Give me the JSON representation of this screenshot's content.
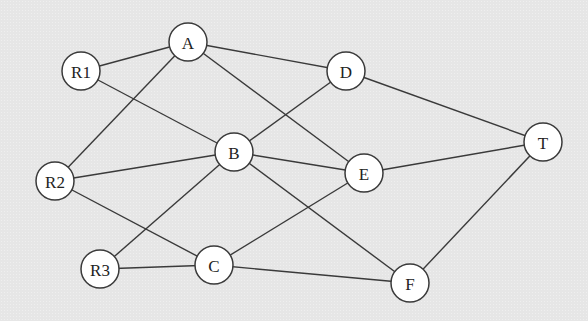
{
  "diagram": {
    "type": "network-graph",
    "colors": {
      "background": "#e6e6e6",
      "node_fill": "#ffffff",
      "stroke": "#3a3a3a",
      "text": "#222222"
    },
    "nodes": [
      {
        "id": "A",
        "label": "A"
      },
      {
        "id": "R1",
        "label": "R1"
      },
      {
        "id": "D",
        "label": "D"
      },
      {
        "id": "B",
        "label": "B"
      },
      {
        "id": "T",
        "label": "T"
      },
      {
        "id": "R2",
        "label": "R2"
      },
      {
        "id": "E",
        "label": "E"
      },
      {
        "id": "R3",
        "label": "R3"
      },
      {
        "id": "C",
        "label": "C"
      },
      {
        "id": "F",
        "label": "F"
      }
    ],
    "edges": [
      [
        "R1",
        "A"
      ],
      [
        "R1",
        "B"
      ],
      [
        "A",
        "D"
      ],
      [
        "A",
        "R2"
      ],
      [
        "A",
        "E"
      ],
      [
        "D",
        "B"
      ],
      [
        "D",
        "T"
      ],
      [
        "R2",
        "B"
      ],
      [
        "R2",
        "C"
      ],
      [
        "B",
        "E"
      ],
      [
        "B",
        "R3"
      ],
      [
        "B",
        "F"
      ],
      [
        "E",
        "T"
      ],
      [
        "E",
        "C"
      ],
      [
        "R3",
        "C"
      ],
      [
        "C",
        "F"
      ],
      [
        "F",
        "T"
      ]
    ]
  }
}
